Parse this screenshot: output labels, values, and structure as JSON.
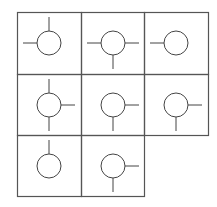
{
  "diagram": {
    "type": "grid-of-connector-symbols",
    "rows": 3,
    "columns": 3,
    "grid_origin": [
      17,
      12
    ],
    "column_edges": [
      17,
      81,
      144,
      208
    ],
    "row_edges": [
      12,
      74,
      135,
      196
    ],
    "colors": {
      "grid_line": "#555555",
      "symbol_line": "#444444",
      "background": "#ffffff"
    },
    "symbol": {
      "circle_center_offset": [
        32,
        31
      ],
      "circle_radius": 12,
      "stub_length": 14
    },
    "cells": [
      {
        "row": 0,
        "col": 0,
        "connectors": [
          "top",
          "left"
        ]
      },
      {
        "row": 0,
        "col": 1,
        "connectors": [
          "left",
          "right",
          "bottom"
        ]
      },
      {
        "row": 0,
        "col": 2,
        "connectors": [
          "left"
        ]
      },
      {
        "row": 1,
        "col": 0,
        "connectors": [
          "top",
          "right",
          "bottom"
        ]
      },
      {
        "row": 1,
        "col": 1,
        "connectors": [
          "right",
          "bottom"
        ]
      },
      {
        "row": 1,
        "col": 2,
        "connectors": [
          "right",
          "bottom"
        ]
      },
      {
        "row": 2,
        "col": 0,
        "connectors": [
          "top"
        ]
      },
      {
        "row": 2,
        "col": 1,
        "connectors": [
          "right",
          "bottom"
        ]
      }
    ]
  }
}
